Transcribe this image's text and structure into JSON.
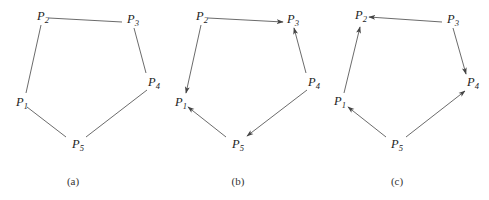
{
  "figure": {
    "panels": [
      {
        "caption": "(a)",
        "offset_x": 0,
        "directed": false,
        "vertices": [
          {
            "name": "P",
            "sub": "1",
            "x": 16,
            "y": 106
          },
          {
            "name": "P",
            "sub": "2",
            "x": 37,
            "y": 20
          },
          {
            "name": "P",
            "sub": "3",
            "x": 127,
            "y": 23
          },
          {
            "name": "P",
            "sub": "4",
            "x": 148,
            "y": 86
          },
          {
            "name": "P",
            "sub": "5",
            "x": 72,
            "y": 148
          }
        ],
        "edges": [
          {
            "from": "P2",
            "to": "P3",
            "x1": 49,
            "y1": 18,
            "x2": 122,
            "y2": 22
          },
          {
            "from": "P3",
            "to": "P4",
            "x1": 134,
            "y1": 28,
            "x2": 146,
            "y2": 73
          },
          {
            "from": "P4",
            "to": "P5",
            "x1": 147,
            "y1": 90,
            "x2": 86,
            "y2": 137
          },
          {
            "from": "P5",
            "to": "P1",
            "x1": 66,
            "y1": 137,
            "x2": 27,
            "y2": 107
          },
          {
            "from": "P1",
            "to": "P2",
            "x1": 26,
            "y1": 93,
            "x2": 41,
            "y2": 25
          }
        ]
      },
      {
        "caption": "(b)",
        "offset_x": 160,
        "directed": true,
        "vertices": [
          {
            "name": "P",
            "sub": "1",
            "x": 175,
            "y": 106
          },
          {
            "name": "P",
            "sub": "2",
            "x": 196,
            "y": 20
          },
          {
            "name": "P",
            "sub": "3",
            "x": 287,
            "y": 23
          },
          {
            "name": "P",
            "sub": "4",
            "x": 308,
            "y": 86
          },
          {
            "name": "P",
            "sub": "5",
            "x": 232,
            "y": 148
          }
        ],
        "edges": [
          {
            "from": "P2",
            "to": "P3",
            "x1": 208,
            "y1": 18,
            "x2": 283,
            "y2": 22
          },
          {
            "from": "P4",
            "to": "P3",
            "x1": 306,
            "y1": 73,
            "x2": 294,
            "y2": 28
          },
          {
            "from": "P4",
            "to": "P5",
            "x1": 307,
            "y1": 90,
            "x2": 247,
            "y2": 136
          },
          {
            "from": "P5",
            "to": "P1",
            "x1": 226,
            "y1": 137,
            "x2": 188,
            "y2": 107
          },
          {
            "from": "P2",
            "to": "P1",
            "x1": 201,
            "y1": 25,
            "x2": 186,
            "y2": 93
          }
        ]
      },
      {
        "caption": "(c)",
        "offset_x": 324,
        "directed": true,
        "vertices": [
          {
            "name": "P",
            "sub": "1",
            "x": 334,
            "y": 105
          },
          {
            "name": "P",
            "sub": "2",
            "x": 355,
            "y": 19
          },
          {
            "name": "P",
            "sub": "3",
            "x": 447,
            "y": 23
          },
          {
            "name": "P",
            "sub": "4",
            "x": 467,
            "y": 86
          },
          {
            "name": "P",
            "sub": "5",
            "x": 391,
            "y": 148
          }
        ],
        "edges": [
          {
            "from": "P3",
            "to": "P2",
            "x1": 442,
            "y1": 22,
            "x2": 369,
            "y2": 17
          },
          {
            "from": "P3",
            "to": "P4",
            "x1": 453,
            "y1": 28,
            "x2": 466,
            "y2": 74
          },
          {
            "from": "P5",
            "to": "P4",
            "x1": 406,
            "y1": 137,
            "x2": 465,
            "y2": 91
          },
          {
            "from": "P5",
            "to": "P1",
            "x1": 386,
            "y1": 137,
            "x2": 348,
            "y2": 107
          },
          {
            "from": "P1",
            "to": "P2",
            "x1": 344,
            "y1": 93,
            "x2": 360,
            "y2": 27
          }
        ]
      }
    ]
  }
}
